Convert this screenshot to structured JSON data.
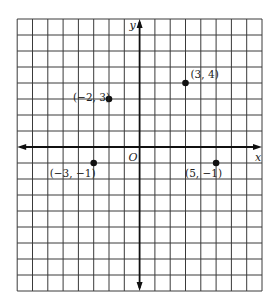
{
  "diagram": {
    "type": "cartesian-coordinate-plane",
    "grid": {
      "x_min": -8,
      "x_max": 8,
      "y_min": -9,
      "y_max": 8,
      "step": 1,
      "origin_px": [
        139.6,
        147
      ],
      "unit_px_x": 15.3,
      "unit_px_y": 16,
      "line_color": "#3a3a3a",
      "axis_color": "#111111"
    },
    "axes": {
      "x_label": "x",
      "y_label": "y",
      "origin_label": "O"
    },
    "points": [
      {
        "x": -2,
        "y": 3,
        "label": "(−2, 3)",
        "label_pos": "left"
      },
      {
        "x": 3,
        "y": 4,
        "label": "(3, 4)",
        "label_pos": "upper-right"
      },
      {
        "x": -3,
        "y": -1,
        "label": "(−3, −1)",
        "label_pos": "below-left"
      },
      {
        "x": 5,
        "y": -1,
        "label": "(5, −1)",
        "label_pos": "below-left"
      }
    ]
  }
}
